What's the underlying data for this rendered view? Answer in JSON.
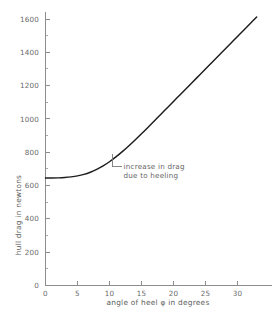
{
  "chart_data": {
    "type": "line",
    "title": "",
    "xlabel": "angle of heel  φ  in degrees",
    "ylabel": "hull drag in newtons",
    "xlim": [
      0,
      33
    ],
    "ylim": [
      0,
      1680
    ],
    "grid": false,
    "legend": null,
    "x_ticks": [
      0,
      5,
      10,
      15,
      20,
      25,
      30
    ],
    "x_tick_labels": [
      "0",
      "5",
      "10",
      "15",
      "20",
      "25",
      "30"
    ],
    "x_minor_step": 1,
    "y_ticks": [
      0,
      200,
      400,
      600,
      800,
      1000,
      1200,
      1400,
      1600
    ],
    "y_tick_labels": [
      "0",
      "200",
      "400",
      "600",
      "800",
      "1000",
      "1200",
      "1400",
      "1600"
    ],
    "y_minor_step": 100,
    "series": [
      {
        "name": "hull drag",
        "color": "#1d1d1d",
        "x": [
          0,
          1,
          2,
          3,
          4,
          5,
          6,
          7,
          8,
          9,
          10,
          11,
          12,
          13,
          14,
          15,
          16,
          17,
          18,
          19,
          20,
          21,
          22,
          23,
          24,
          25,
          26,
          27,
          28,
          29,
          30,
          31,
          32,
          33
        ],
        "values": [
          645,
          645,
          646,
          648,
          652,
          658,
          667,
          680,
          697,
          718,
          743,
          772,
          804,
          838,
          874,
          911,
          949,
          988,
          1027,
          1066,
          1105,
          1144,
          1183,
          1222,
          1261,
          1300,
          1339,
          1378,
          1417,
          1456,
          1495,
          1534,
          1573,
          1612
        ]
      }
    ],
    "annotations": [
      {
        "name": "increase-in-drag",
        "line1": "increase in drag",
        "line2": "due to heeling",
        "anchor_x": 10.4,
        "anchor_y": 790,
        "text_x": 12.2,
        "text_y": 700
      }
    ]
  },
  "axis": {
    "x_title": "angle of heel  φ  in degrees",
    "y_title": "hull drag in newtons"
  },
  "colors": {
    "curve": "#1d1d1d",
    "axis": "#8d8d8d",
    "text": "#666666",
    "background": "#ffffff"
  }
}
